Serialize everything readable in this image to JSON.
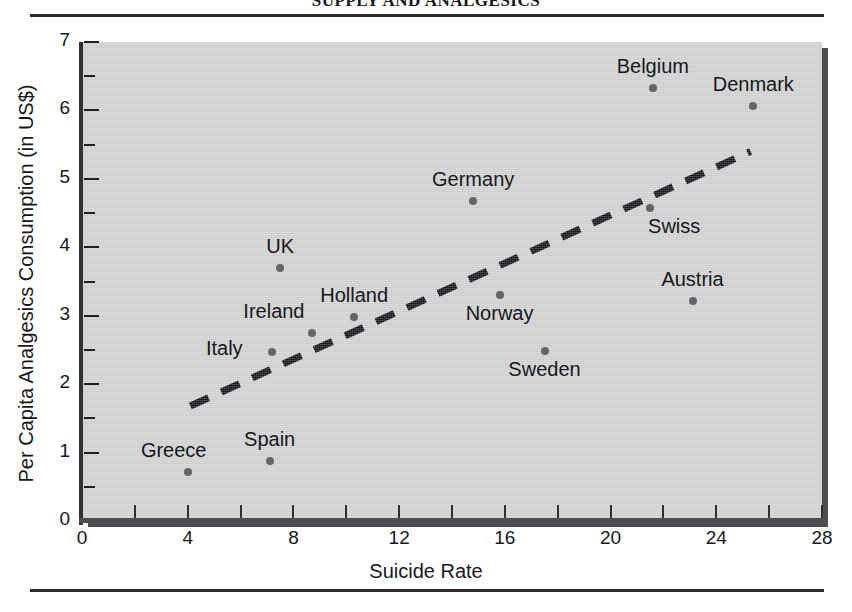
{
  "page": {
    "running_head": "SUPPLY AND ANALGESICS",
    "has_top_rule": true,
    "has_bottom_rule": true
  },
  "chart_data": {
    "type": "scatter",
    "title": "",
    "xlabel": "Suicide Rate",
    "ylabel": "Per Capita Analgesics Consumption (in US$)",
    "xlim": [
      0,
      28
    ],
    "ylim": [
      0,
      7
    ],
    "xticks": [
      0,
      4,
      8,
      12,
      16,
      20,
      24,
      28
    ],
    "xticklabels": [
      "0",
      "4",
      "8",
      "12",
      "16",
      "20",
      "24",
      "28"
    ],
    "yticks": [
      0,
      1,
      2,
      3,
      4,
      5,
      6,
      7
    ],
    "yticklabels": [
      "0",
      "1",
      "2",
      "3",
      "4",
      "5",
      "6",
      "7"
    ],
    "yminorticks": [
      0.5,
      1.5,
      2.5,
      3.5,
      4.5,
      5.5,
      6.5
    ],
    "grid": false,
    "legend": false,
    "plot_background": "#d2d2d2",
    "marker_color": "#636569",
    "trendline": {
      "style": "dashed",
      "color": "#111317",
      "x_start": 4.1,
      "y_start": 1.68,
      "x_end": 25.3,
      "y_end": 5.4
    },
    "points": [
      {
        "label": "Greece",
        "x": 4.0,
        "y": 0.72,
        "label_dx": -14,
        "label_dy": -10
      },
      {
        "label": "Spain",
        "x": 7.1,
        "y": 0.88,
        "label_dx": 0,
        "label_dy": -10
      },
      {
        "label": "Italy",
        "x": 7.2,
        "y": 2.47,
        "label_dx": -48,
        "label_dy": 8
      },
      {
        "label": "UK",
        "x": 7.5,
        "y": 3.7,
        "label_dx": 0,
        "label_dy": -10
      },
      {
        "label": "Ireland",
        "x": 8.7,
        "y": 2.75,
        "label_dx": -38,
        "label_dy": -10
      },
      {
        "label": "Holland",
        "x": 10.3,
        "y": 2.98,
        "label_dx": 0,
        "label_dy": -10
      },
      {
        "label": "Germany",
        "x": 14.8,
        "y": 4.68,
        "label_dx": 0,
        "label_dy": -10
      },
      {
        "label": "Norway",
        "x": 15.8,
        "y": 3.3,
        "label_dx": 0,
        "label_dy": 30
      },
      {
        "label": "Sweden",
        "x": 17.5,
        "y": 2.48,
        "label_dx": 0,
        "label_dy": 30
      },
      {
        "label": "Belgium",
        "x": 21.6,
        "y": 6.33,
        "label_dx": 0,
        "label_dy": -10
      },
      {
        "label": "Swiss",
        "x": 21.5,
        "y": 4.58,
        "label_dx": 24,
        "label_dy": 30
      },
      {
        "label": "Austria",
        "x": 23.1,
        "y": 3.22,
        "label_dx": 0,
        "label_dy": -10
      },
      {
        "label": "Denmark",
        "x": 25.4,
        "y": 6.07,
        "label_dx": 0,
        "label_dy": -10
      }
    ]
  }
}
